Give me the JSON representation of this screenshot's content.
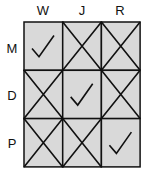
{
  "grid": {
    "columns": [
      "W",
      "J",
      "R"
    ],
    "rows": [
      "M",
      "D",
      "P"
    ],
    "cells": [
      [
        "check",
        "cross",
        "cross"
      ],
      [
        "cross",
        "check",
        "cross"
      ],
      [
        "cross",
        "cross",
        "check"
      ]
    ],
    "colors": {
      "fill": "#d9d9d9",
      "line": "#111111"
    }
  }
}
